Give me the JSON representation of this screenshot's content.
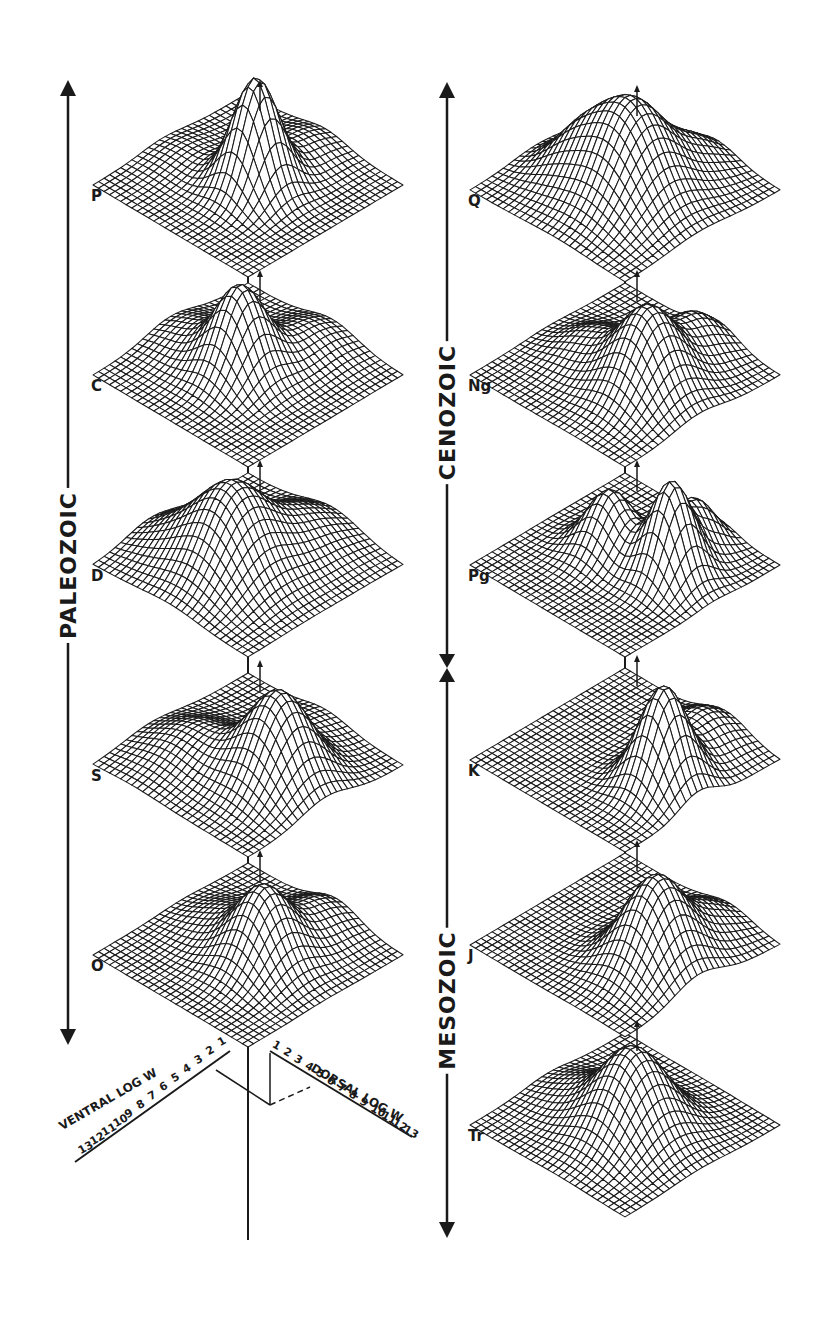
{
  "figure": {
    "colors": {
      "ink": "#1a1a1a",
      "background": "#ffffff",
      "surface_highlight": "#ffffff"
    }
  },
  "eras": [
    {
      "id": "paleozoic",
      "label": "PALEOZOIC",
      "column": "left",
      "arrow_top": 80,
      "arrow_bottom": 1045,
      "label_center_y": 565,
      "x": 68
    },
    {
      "id": "cenozoic",
      "label": "CENOZOIC",
      "column": "right",
      "arrow_top": 82,
      "arrow_bottom": 668,
      "label_center_y": 412,
      "x": 447
    },
    {
      "id": "mesozoic",
      "label": "MESOZOIC",
      "column": "right",
      "arrow_top": 668,
      "arrow_bottom": 1238,
      "label_center_y": 1000,
      "x": 447
    }
  ],
  "periods": [
    {
      "code": "P",
      "name": "Permian",
      "column": "left",
      "cx": 248,
      "cy": 185,
      "peaks": [
        {
          "u": 0.05,
          "v": -0.05,
          "h": 110,
          "s": 0.16
        },
        {
          "u": 0.35,
          "v": 0.35,
          "h": 18,
          "s": 0.2
        },
        {
          "u": -0.4,
          "v": 0.3,
          "h": 10,
          "s": 0.2
        }
      ]
    },
    {
      "code": "C",
      "name": "Carboniferous",
      "column": "left",
      "cx": 248,
      "cy": 375,
      "peaks": [
        {
          "u": -0.05,
          "v": 0.0,
          "h": 85,
          "s": 0.18
        },
        {
          "u": 0.4,
          "v": 0.3,
          "h": 22,
          "s": 0.22
        },
        {
          "u": -0.35,
          "v": 0.35,
          "h": 20,
          "s": 0.22
        }
      ]
    },
    {
      "code": "D",
      "name": "Devonian",
      "column": "left",
      "cx": 248,
      "cy": 565,
      "peaks": [
        {
          "u": -0.1,
          "v": -0.1,
          "h": 85,
          "s": 0.25
        },
        {
          "u": 0.35,
          "v": 0.25,
          "h": 30,
          "s": 0.25
        },
        {
          "u": -0.45,
          "v": 0.2,
          "h": 22,
          "s": 0.22
        }
      ]
    },
    {
      "code": "S",
      "name": "Silurian",
      "column": "left",
      "cx": 248,
      "cy": 765,
      "peaks": [
        {
          "u": 0.2,
          "v": -0.2,
          "h": 90,
          "s": 0.22
        },
        {
          "u": -0.35,
          "v": 0.1,
          "h": 28,
          "s": 0.25
        },
        {
          "u": 0.4,
          "v": 0.4,
          "h": 12,
          "s": 0.2
        }
      ]
    },
    {
      "code": "O",
      "name": "Ordovician",
      "column": "left",
      "cx": 248,
      "cy": 955,
      "peaks": [
        {
          "u": 0.1,
          "v": -0.1,
          "h": 75,
          "s": 0.2
        },
        {
          "u": 0.45,
          "v": 0.3,
          "h": 25,
          "s": 0.2
        },
        {
          "u": -0.15,
          "v": 0.3,
          "h": 18,
          "s": 0.2
        }
      ]
    },
    {
      "code": "Q",
      "name": "Quaternary",
      "column": "right",
      "cx": 625,
      "cy": 190,
      "peaks": [
        {
          "u": 0.05,
          "v": -0.1,
          "h": 95,
          "s": 0.26
        },
        {
          "u": -0.3,
          "v": 0.15,
          "h": 35,
          "s": 0.2
        },
        {
          "u": 0.45,
          "v": 0.25,
          "h": 22,
          "s": 0.18
        }
      ]
    },
    {
      "code": "Ng",
      "name": "Neogene",
      "column": "right",
      "cx": 625,
      "cy": 375,
      "peaks": [
        {
          "u": 0.15,
          "v": -0.2,
          "h": 85,
          "s": 0.22
        },
        {
          "u": 0.45,
          "v": 0.25,
          "h": 35,
          "s": 0.18
        },
        {
          "u": -0.2,
          "v": 0.2,
          "h": 25,
          "s": 0.2
        }
      ]
    },
    {
      "code": "Pg",
      "name": "Paleogene",
      "column": "right",
      "cx": 625,
      "cy": 565,
      "peaks": [
        {
          "u": 0.3,
          "v": -0.15,
          "h": 95,
          "s": 0.15
        },
        {
          "u": -0.1,
          "v": 0.15,
          "h": 60,
          "s": 0.16
        },
        {
          "u": 0.45,
          "v": 0.2,
          "h": 45,
          "s": 0.14
        }
      ]
    },
    {
      "code": "K",
      "name": "Cretaceous",
      "column": "right",
      "cx": 625,
      "cy": 760,
      "peaks": [
        {
          "u": 0.25,
          "v": -0.3,
          "h": 100,
          "s": 0.17
        },
        {
          "u": 0.5,
          "v": 0.2,
          "h": 30,
          "s": 0.2
        }
      ]
    },
    {
      "code": "J",
      "name": "Jurassic",
      "column": "right",
      "cx": 625,
      "cy": 945,
      "peaks": [
        {
          "u": 0.2,
          "v": -0.25,
          "h": 90,
          "s": 0.22
        },
        {
          "u": 0.5,
          "v": 0.15,
          "h": 25,
          "s": 0.2
        }
      ]
    },
    {
      "code": "Tr",
      "name": "Triassic",
      "column": "right",
      "cx": 625,
      "cy": 1125,
      "peaks": [
        {
          "u": 0.05,
          "v": -0.1,
          "h": 85,
          "s": 0.24
        },
        {
          "u": -0.3,
          "v": 0.3,
          "h": 15,
          "s": 0.2
        }
      ]
    }
  ],
  "axes": {
    "ventral": {
      "label": "VENTRAL LOG W",
      "ticks": [
        "1",
        "2",
        "3",
        "4",
        "5",
        "6",
        "7",
        "8",
        "9",
        "10",
        "11",
        "12",
        "13"
      ]
    },
    "dorsal": {
      "label": "DORSAL LOG W",
      "ticks": [
        "1",
        "2",
        "3",
        "4",
        "5",
        "6",
        "7",
        "8",
        "9",
        "10",
        "11",
        "12",
        "13"
      ]
    }
  },
  "panel_geometry": {
    "half_width": 155,
    "half_height": 92,
    "grid_n": 28
  }
}
